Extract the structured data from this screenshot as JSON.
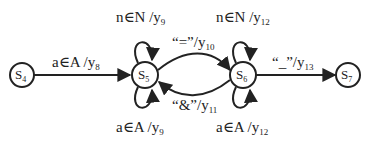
{
  "diagram": {
    "type": "finite-state-machine",
    "nodes": [
      {
        "id": "s4",
        "label": "S",
        "sub": "4",
        "cx": 22,
        "cy": 75
      },
      {
        "id": "s5",
        "label": "S",
        "sub": "5",
        "cx": 145,
        "cy": 75
      },
      {
        "id": "s6",
        "label": "S",
        "sub": "6",
        "cx": 243,
        "cy": 75
      },
      {
        "id": "s7",
        "label": "S",
        "sub": "7",
        "cx": 348,
        "cy": 75
      }
    ],
    "edges": [
      {
        "id": "e-s4-s5",
        "from": "s4",
        "to": "s5",
        "label": "a∈A /y",
        "sub": "8"
      },
      {
        "id": "e-s5-s5-top",
        "from": "s5",
        "to": "s5",
        "label": "n∈N /y",
        "sub": "9"
      },
      {
        "id": "e-s5-s5-bottom",
        "from": "s5",
        "to": "s5",
        "label": "a∈A /y",
        "sub": "9"
      },
      {
        "id": "e-s5-s6",
        "from": "s5",
        "to": "s6",
        "label": "“=”/y",
        "sub": "10"
      },
      {
        "id": "e-s6-s5",
        "from": "s6",
        "to": "s5",
        "label": "“&”/y",
        "sub": "11"
      },
      {
        "id": "e-s6-s6-top",
        "from": "s6",
        "to": "s6",
        "label": "n∈N /y",
        "sub": "12"
      },
      {
        "id": "e-s6-s6-bottom",
        "from": "s6",
        "to": "s6",
        "label": "a∈A /y",
        "sub": "12"
      },
      {
        "id": "e-s6-s7",
        "from": "s6",
        "to": "s7",
        "label": "“_”/y",
        "sub": "13"
      }
    ]
  }
}
